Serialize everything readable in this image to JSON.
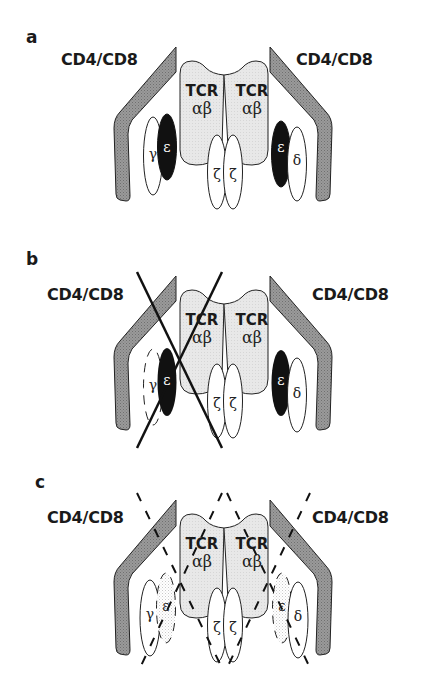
{
  "figure": {
    "panels": [
      {
        "label": "a",
        "left_coreceptor": "CD4/CD8",
        "right_coreceptor": "CD4/CD8",
        "tcr_left": {
          "name": "TCR",
          "chains": "αβ"
        },
        "tcr_right": {
          "name": "TCR",
          "chains": "αβ"
        },
        "cd3_left": {
          "gamma": "γ",
          "epsilon": "ε"
        },
        "cd3_right": {
          "epsilon": "ε",
          "delta": "δ"
        },
        "zeta": [
          "ζ",
          "ζ"
        ],
        "state": "intact complex"
      },
      {
        "label": "b",
        "left_coreceptor": "CD4/CD8",
        "right_coreceptor": "CD4/CD8",
        "tcr_left": {
          "name": "TCR",
          "chains": "αβ"
        },
        "tcr_right": {
          "name": "TCR",
          "chains": "αβ"
        },
        "cd3_left": {
          "gamma": "γ",
          "epsilon": "ε"
        },
        "cd3_right": {
          "epsilon": "ε",
          "delta": "δ"
        },
        "zeta": [
          "ζ",
          "ζ"
        ],
        "state": "left half crossed out"
      },
      {
        "label": "c",
        "left_coreceptor": "CD4/CD8",
        "right_coreceptor": "CD4/CD8",
        "tcr_left": {
          "name": "TCR",
          "chains": "αβ"
        },
        "tcr_right": {
          "name": "TCR",
          "chains": "αβ"
        },
        "cd3_left": {
          "gamma": "γ",
          "epsilon": "ε"
        },
        "cd3_right": {
          "epsilon": "ε",
          "delta": "δ"
        },
        "zeta": [
          "ζ",
          "ζ"
        ],
        "state": "both halves dashed-crossed"
      }
    ],
    "colors": {
      "coreceptor_fill": "#8c8c8c",
      "tcr_fill": "#e6e6e6",
      "epsilon_fill": "#111111",
      "outline": "#222222",
      "background": "#ffffff"
    }
  }
}
